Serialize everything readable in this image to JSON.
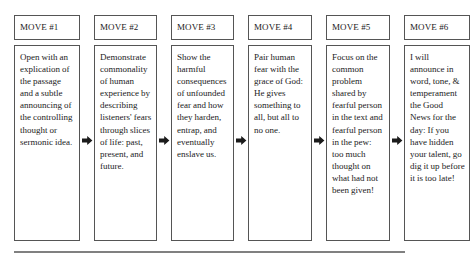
{
  "diagram": {
    "arrow_icon": "right-arrow-icon",
    "border_color": "#555555",
    "rule_color": "#808080",
    "background": "#ffffff",
    "moves": [
      {
        "header": "MOVE #1",
        "body": "Open with an explication of the passage and a subtle announcing of the controlling thought or sermonic idea."
      },
      {
        "header": "MOVE #2",
        "body": "Demonstrate commonality of human experience by describing listeners' fears through slices of life: past, present, and future."
      },
      {
        "header": "MOVE #3",
        "body": "Show the harmful consequences of unfounded fear and how they harden, entrap, and eventually enslave us."
      },
      {
        "header": "MOVE #4",
        "body": "Pair human fear with the grace of God: He gives something to all, but all to no one."
      },
      {
        "header": "MOVE #5",
        "body": "Focus on the common problem shared by fearful person in the text and fearful person in the pew: too much thought on what had not been given!"
      },
      {
        "header": "MOVE #6",
        "body": "I will announce in word, tone, & temperament the Good News for the day: If you have hidden your talent, go dig it up before it is too late!"
      }
    ]
  }
}
